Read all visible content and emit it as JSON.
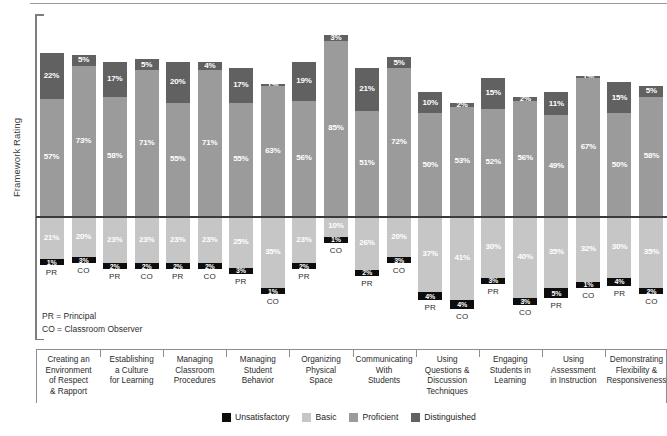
{
  "axis": {
    "y_label": "Framework Rating"
  },
  "notes": {
    "pr": "PR = Principal",
    "co": "CO = Classroom Observer",
    "pr_tag": "PR",
    "co_tag": "CO"
  },
  "legend": {
    "items": [
      {
        "label": "Unsatisfactory",
        "color": "#0d0d0d"
      },
      {
        "label": "Basic",
        "color": "#c6c6c6"
      },
      {
        "label": "Proficient",
        "color": "#9b9b9b"
      },
      {
        "label": "Distinguished",
        "color": "#616161"
      }
    ]
  },
  "chart_data": {
    "type": "bar",
    "title": "",
    "xlabel": "",
    "ylabel": "Framework Rating",
    "stacked": true,
    "orientation": "vertical",
    "baseline_note": "Horizontal rule separates Proficient/Distinguished (above) from Basic/Unsatisfactory (below)",
    "grid": false,
    "legend_position": "bottom",
    "series_names": [
      "Unsatisfactory",
      "Basic",
      "Proficient",
      "Distinguished"
    ],
    "series_colors": [
      "#0d0d0d",
      "#c6c6c6",
      "#9b9b9b",
      "#616161"
    ],
    "raters": [
      "PR",
      "CO"
    ],
    "categories": [
      "Creating an Environment of Respect & Rapport",
      "Establishing a Culture for Learning",
      "Managing Classroom Procedures",
      "Managing Student Behavior",
      "Organizing Physical Space",
      "Communicating With Students",
      "Using Questions & Discussion Techniques",
      "Engaging Students in Learning",
      "Using Assessment in Instruction",
      "Demonstrating Flexibility & Responsiveness"
    ],
    "category_lines": [
      [
        "Creating an",
        "Environment",
        "of Respect",
        "& Rapport"
      ],
      [
        "Establishing",
        "a Culture",
        "for Learning"
      ],
      [
        "Managing",
        "Classroom",
        "Procedures"
      ],
      [
        "Managing",
        "Student",
        "Behavior"
      ],
      [
        "Organizing",
        "Physical",
        "Space"
      ],
      [
        "Communicating",
        "With",
        "Students"
      ],
      [
        "Using",
        "Questions &",
        "Discussion",
        "Techniques"
      ],
      [
        "Engaging",
        "Students in",
        "Learning"
      ],
      [
        "Using",
        "Assessment",
        "in Instruction"
      ],
      [
        "Demonstrating",
        "Flexibility &",
        "Responsiveness"
      ]
    ],
    "groups": [
      {
        "category": "Creating an Environment of Respect & Rapport",
        "bars": [
          {
            "rater": "PR",
            "unsatisfactory": 1,
            "basic": 21,
            "proficient": 57,
            "distinguished": 22
          },
          {
            "rater": "CO",
            "unsatisfactory": 3,
            "basic": 20,
            "proficient": 73,
            "distinguished": 5
          }
        ]
      },
      {
        "category": "Establishing a Culture for Learning",
        "bars": [
          {
            "rater": "PR",
            "unsatisfactory": 2,
            "basic": 23,
            "proficient": 58,
            "distinguished": 17
          },
          {
            "rater": "CO",
            "unsatisfactory": 2,
            "basic": 23,
            "proficient": 71,
            "distinguished": 5
          }
        ]
      },
      {
        "category": "Managing Classroom Procedures",
        "bars": [
          {
            "rater": "PR",
            "unsatisfactory": 2,
            "basic": 23,
            "proficient": 55,
            "distinguished": 20
          },
          {
            "rater": "CO",
            "unsatisfactory": 2,
            "basic": 23,
            "proficient": 71,
            "distinguished": 4
          }
        ]
      },
      {
        "category": "Managing Student Behavior",
        "bars": [
          {
            "rater": "PR",
            "unsatisfactory": 3,
            "basic": 25,
            "proficient": 55,
            "distinguished": 17
          },
          {
            "rater": "CO",
            "unsatisfactory": 1,
            "basic": 35,
            "proficient": 63,
            "distinguished": 1
          }
        ]
      },
      {
        "category": "Organizing Physical Space",
        "bars": [
          {
            "rater": "PR",
            "unsatisfactory": 2,
            "basic": 23,
            "proficient": 56,
            "distinguished": 19
          },
          {
            "rater": "CO",
            "unsatisfactory": 1,
            "basic": 10,
            "proficient": 85,
            "distinguished": 3
          }
        ]
      },
      {
        "category": "Communicating With Students",
        "bars": [
          {
            "rater": "PR",
            "unsatisfactory": 2,
            "basic": 26,
            "proficient": 51,
            "distinguished": 21
          },
          {
            "rater": "CO",
            "unsatisfactory": 3,
            "basic": 20,
            "proficient": 72,
            "distinguished": 5
          }
        ]
      },
      {
        "category": "Using Questions & Discussion Techniques",
        "bars": [
          {
            "rater": "PR",
            "unsatisfactory": 4,
            "basic": 37,
            "proficient": 50,
            "distinguished": 10
          },
          {
            "rater": "CO",
            "unsatisfactory": 4,
            "basic": 41,
            "proficient": 53,
            "distinguished": 2
          }
        ]
      },
      {
        "category": "Engaging Students in Learning",
        "bars": [
          {
            "rater": "PR",
            "unsatisfactory": 3,
            "basic": 30,
            "proficient": 52,
            "distinguished": 15
          },
          {
            "rater": "CO",
            "unsatisfactory": 3,
            "basic": 40,
            "proficient": 56,
            "distinguished": 2
          }
        ]
      },
      {
        "category": "Using Assessment in Instruction",
        "bars": [
          {
            "rater": "PR",
            "unsatisfactory": 5,
            "basic": 35,
            "proficient": 49,
            "distinguished": 11
          },
          {
            "rater": "CO",
            "unsatisfactory": 1,
            "basic": 32,
            "proficient": 67,
            "distinguished": 1
          }
        ]
      },
      {
        "category": "Demonstrating Flexibility & Responsiveness",
        "bars": [
          {
            "rater": "PR",
            "unsatisfactory": 4,
            "basic": 30,
            "proficient": 50,
            "distinguished": 15
          },
          {
            "rater": "CO",
            "unsatisfactory": 2,
            "basic": 35,
            "proficient": 58,
            "distinguished": 5
          }
        ]
      }
    ]
  }
}
